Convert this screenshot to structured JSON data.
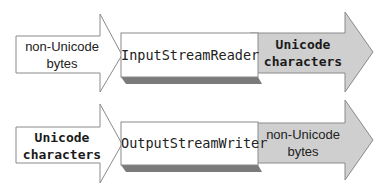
{
  "colors": {
    "background": "#ffffff",
    "input_arrow_fill": "#ffffff",
    "output_arrow_fill": "#cfcfcf",
    "stroke": "#8a8a8a",
    "box_fill": "#ffffff",
    "box_shadow": "#7a7a7a"
  },
  "rows": [
    {
      "input": {
        "line1": "non-Unicode",
        "line2": "bytes"
      },
      "converter": {
        "label": "InputStreamReader"
      },
      "output": {
        "line1": "Unicode",
        "line2": "characters"
      }
    },
    {
      "input": {
        "line1": "Unicode",
        "line2": "characters"
      },
      "converter": {
        "label": "OutputStreamWriter"
      },
      "output": {
        "line1": "non-Unicode",
        "line2": "bytes"
      }
    }
  ]
}
